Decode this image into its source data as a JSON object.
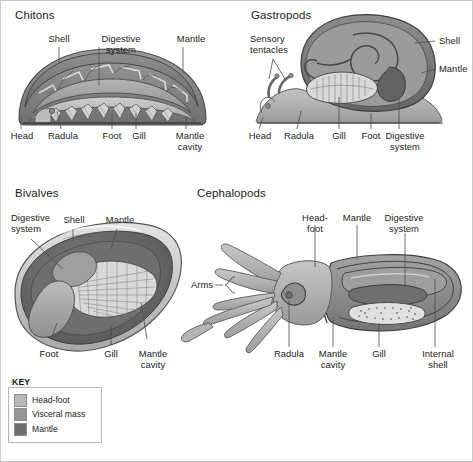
{
  "figure": {
    "background": "#ffffff",
    "border_color": "#c9c9c9",
    "leader_color": "#4c4c4c",
    "text_color": "#1b1b1b"
  },
  "panels": [
    {
      "id": "chitons",
      "title": "Chitons",
      "labels": {
        "shell": "Shell",
        "digestive_system": "Digestive system",
        "mantle": "Mantle",
        "head": "Head",
        "radula": "Radula",
        "foot": "Foot",
        "gill": "Gill",
        "mantle_cavity": "Mantle\ncavity"
      }
    },
    {
      "id": "gastropods",
      "title": "Gastropods",
      "labels": {
        "sensory_tentacles": "Sensory\ntentacles",
        "shell": "Shell",
        "mantle": "Mantle",
        "head": "Head",
        "radula": "Radula",
        "gill": "Gill",
        "foot": "Foot",
        "digestive_system": "Digestive\nsystem"
      }
    },
    {
      "id": "bivalves",
      "title": "Bivalves",
      "labels": {
        "digestive_system": "Digestive\nsystem",
        "shell": "Shell",
        "mantle_top": "Mantle",
        "foot": "Foot",
        "gill": "Gill",
        "mantle_cavity": "Mantle\ncavity"
      }
    },
    {
      "id": "cephalopods",
      "title": "Cephalopods",
      "labels": {
        "head_foot": "Head-foot",
        "mantle": "Mantle",
        "digestive_system": "Digestive\nsystem",
        "arms": "Arms",
        "radula": "Radula",
        "mantle_cavity": "Mantle\ncavity",
        "gill": "Gill",
        "internal_shell": "Internal\nshell"
      }
    }
  ],
  "key": {
    "title": "KEY",
    "items": [
      {
        "label": "Head-foot",
        "color": "#b9b9b9"
      },
      {
        "label": "Visceral mass",
        "color": "#959595"
      },
      {
        "label": "Mantle",
        "color": "#6e6e6e"
      }
    ]
  }
}
